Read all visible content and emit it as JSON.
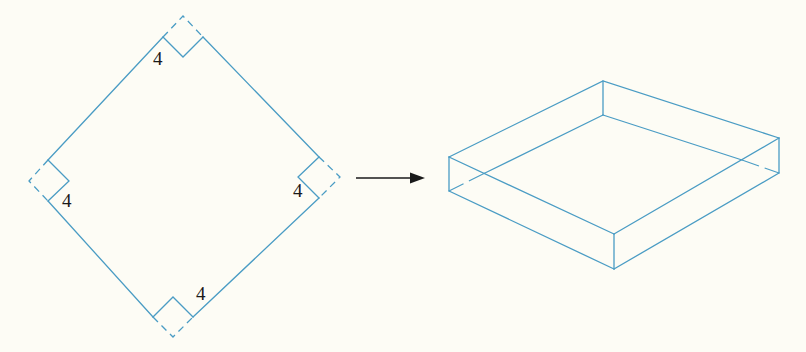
{
  "figure": {
    "stroke_color": "#4a9cc4",
    "arrow_color": "#1a1a1a",
    "background": "#fdfcf5"
  },
  "net": {
    "corner_cut_labels": [
      {
        "position": "top",
        "text": "4"
      },
      {
        "position": "left",
        "text": "4"
      },
      {
        "position": "right",
        "text": "4"
      },
      {
        "position": "bottom",
        "text": "4"
      }
    ],
    "fold_lines": "dashed"
  },
  "arrow": {
    "direction": "right",
    "meaning": "fold into box"
  },
  "box": {
    "type": "open-top box (isometric view)",
    "hidden_edges": "dashed"
  }
}
